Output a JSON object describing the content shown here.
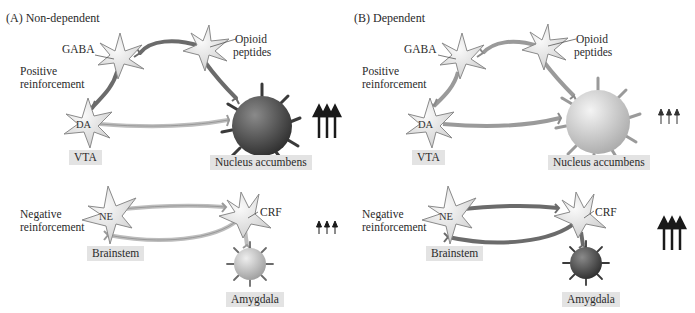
{
  "figure": {
    "panels": [
      {
        "id": "A",
        "title": "(A)  Non-dependent",
        "neurons": {
          "gaba": "GABA",
          "opioid": "Opioid\npeptides",
          "opioid_line1": "Opioid",
          "opioid_line2": "peptides",
          "da": "DA",
          "ne": "NE",
          "crf": "CRF"
        },
        "labels": {
          "positive_line1": "Positive",
          "positive_line2": "reinforcement",
          "negative_line1": "Negative",
          "negative_line2": "reinforcement"
        },
        "regions": {
          "vta": "VTA",
          "nucleus_accumbens": "Nucleus accumbens",
          "brainstem": "Brainstem",
          "amygdala": "Amygdala"
        },
        "activity": {
          "positive_reinforcement": "high",
          "negative_reinforcement": "low",
          "nucleus_accumbens_color": "#3d3d3d",
          "amygdala_color": "#bdbdbd",
          "positive_arrows": "↑↑↑ (large)",
          "negative_arrows": "↑↑↑ (small)"
        }
      },
      {
        "id": "B",
        "title": "(B)  Dependent",
        "neurons": {
          "gaba": "GABA",
          "opioid_line1": "Opioid",
          "opioid_line2": "peptides",
          "da": "DA",
          "ne": "NE",
          "crf": "CRF"
        },
        "labels": {
          "positive_line1": "Positive",
          "positive_line2": "reinforcement",
          "negative_line1": "Negative",
          "negative_line2": "reinforcement"
        },
        "regions": {
          "vta": "VTA",
          "nucleus_accumbens": "Nucleus accumbens",
          "brainstem": "Brainstem",
          "amygdala": "Amygdala"
        },
        "activity": {
          "positive_reinforcement": "low",
          "negative_reinforcement": "high",
          "nucleus_accumbens_color": "#c8c8c8",
          "amygdala_color": "#3d3d3d",
          "positive_arrows": "↑↑↑ (small)",
          "negative_arrows": "↑↑↑ (large)"
        }
      }
    ],
    "colors": {
      "neuron_fill": "#e9e9e9",
      "neuron_stroke": "#8a8a8a",
      "axon_light": "#bdbdbd",
      "axon_dark": "#6b6b6b",
      "region_box": "#e3e3e3",
      "arrow": "#1a1a1a"
    }
  }
}
